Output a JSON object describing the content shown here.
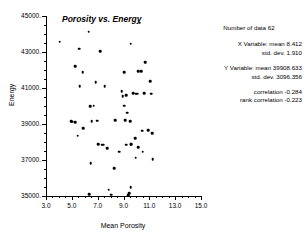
{
  "chart_data": {
    "type": "scatter",
    "title": "Porosity vs. Energy",
    "xlabel": "Mean Porosity",
    "ylabel": "Energy",
    "xlim": [
      3.0,
      15.0
    ],
    "ylim": [
      35000,
      45000
    ],
    "xticks": [
      "3.0",
      "5.0",
      "7.0",
      "9.0",
      "11.0",
      "13.0",
      "15.0"
    ],
    "xtick_values": [
      3.0,
      5.0,
      7.0,
      9.0,
      11.0,
      13.0,
      15.0
    ],
    "yticks": [
      "45000.",
      "43000.",
      "41000.",
      "39000.",
      "37000.",
      "35000."
    ],
    "ytick_values": [
      45000,
      43000,
      41000,
      39000,
      37000,
      35000
    ],
    "grid": false,
    "legend": false,
    "marker": "filled-circle",
    "marker_color": "#000000",
    "points": [
      [
        4.05,
        43570
      ],
      [
        6.3,
        44120
      ],
      [
        10.25,
        44620
      ],
      [
        5.55,
        43180
      ],
      [
        9.55,
        43450
      ],
      [
        7.2,
        43040
      ],
      [
        5.25,
        42220
      ],
      [
        10.7,
        42420
      ],
      [
        5.85,
        41880
      ],
      [
        9.05,
        41890
      ],
      [
        10.15,
        41920
      ],
      [
        5.6,
        41100
      ],
      [
        6.85,
        41310
      ],
      [
        7.55,
        41110
      ],
      [
        11.05,
        41390
      ],
      [
        8.85,
        40810
      ],
      [
        10.6,
        40700
      ],
      [
        11.15,
        40690
      ],
      [
        9.75,
        40720
      ],
      [
        10.05,
        40690
      ],
      [
        6.4,
        39990
      ],
      [
        9.05,
        40020
      ],
      [
        9.3,
        39630
      ],
      [
        5.05,
        39130
      ],
      [
        5.25,
        39100
      ],
      [
        6.55,
        39170
      ],
      [
        6.95,
        39190
      ],
      [
        8.35,
        39210
      ],
      [
        9.5,
        39150
      ],
      [
        5.9,
        38770
      ],
      [
        10.45,
        38620
      ],
      [
        11.2,
        38500
      ],
      [
        5.45,
        38340
      ],
      [
        9.9,
        38200
      ],
      [
        7.05,
        37880
      ],
      [
        7.45,
        37850
      ],
      [
        9.2,
        37840
      ],
      [
        9.55,
        37870
      ],
      [
        7.75,
        37660
      ],
      [
        10.15,
        37710
      ],
      [
        8.65,
        37450
      ],
      [
        9.95,
        37120
      ],
      [
        11.25,
        37060
      ],
      [
        6.45,
        36830
      ],
      [
        8.3,
        36560
      ],
      [
        9.55,
        35480
      ],
      [
        7.85,
        35340
      ],
      [
        9.45,
        35140
      ],
      [
        6.35,
        35100
      ],
      [
        8.05,
        35070
      ],
      [
        9.35,
        35060
      ],
      [
        6.7,
        40010
      ],
      [
        9.2,
        40600
      ],
      [
        9.95,
        40680
      ],
      [
        8.95,
        40540
      ],
      [
        10.35,
        41930
      ],
      [
        4.95,
        39140
      ],
      [
        9.15,
        39200
      ],
      [
        10.9,
        38640
      ],
      [
        7.3,
        37860
      ],
      [
        9.6,
        37880
      ],
      [
        10.5,
        37450
      ]
    ]
  },
  "stats": {
    "count_label": "Number of data",
    "count_value": "62",
    "x_var_label": "X Variable: mean",
    "x_mean": "8.412",
    "x_sd_label": "std. dev.",
    "x_sd": "1.910",
    "y_var_label": "Y Variable: mean",
    "y_mean": "39908.633",
    "y_sd_label": "std. dev.",
    "y_sd": "3096.356",
    "corr_label": "correlation",
    "corr_value": "-0.284",
    "rank_corr_label": "rank correlation",
    "rank_corr_value": "-0.223"
  }
}
